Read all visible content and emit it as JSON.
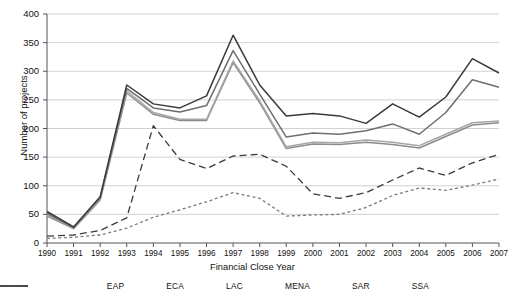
{
  "chart_data": {
    "type": "line",
    "title": "",
    "xlabel": "Financial Close Year",
    "ylabel": "Number of projects",
    "x": [
      1990,
      1991,
      1992,
      1993,
      1994,
      1995,
      1996,
      1997,
      1998,
      1999,
      2000,
      2001,
      2002,
      2003,
      2004,
      2005,
      2006,
      2007
    ],
    "xlim": [
      1990,
      2007
    ],
    "ylim": [
      0,
      400
    ],
    "yticks": [
      0,
      50,
      100,
      150,
      200,
      250,
      300,
      350,
      400
    ],
    "grid": true,
    "legend_position": "bottom",
    "series": [
      {
        "name": "EAP",
        "style": "dotted",
        "color": "#7a7a7a",
        "values": [
          8,
          10,
          14,
          26,
          45,
          58,
          72,
          88,
          78,
          47,
          49,
          50,
          62,
          83,
          96,
          92,
          101,
          112
        ]
      },
      {
        "name": "ECA",
        "style": "dashed",
        "color": "#3c3c3c",
        "values": [
          12,
          14,
          22,
          44,
          205,
          146,
          130,
          152,
          155,
          134,
          86,
          78,
          88,
          110,
          131,
          118,
          140,
          155
        ]
      },
      {
        "name": "LAC",
        "style": "solid",
        "color": "#8c8c8c",
        "values": [
          47,
          25,
          75,
          262,
          225,
          214,
          214,
          315,
          245,
          165,
          173,
          172,
          176,
          172,
          166,
          186,
          206,
          210
        ]
      },
      {
        "name": "MENA",
        "style": "solid",
        "color": "#a6a6a6",
        "values": [
          49,
          26,
          77,
          266,
          228,
          216,
          216,
          318,
          248,
          168,
          176,
          175,
          180,
          176,
          170,
          190,
          210,
          213
        ]
      },
      {
        "name": "SAR",
        "style": "solid",
        "color": "#6e6e6e",
        "values": [
          52,
          27,
          79,
          270,
          236,
          229,
          240,
          336,
          260,
          185,
          192,
          190,
          196,
          208,
          190,
          228,
          285,
          272
        ]
      },
      {
        "name": "SSA",
        "style": "solid",
        "color": "#3a3a3a",
        "values": [
          55,
          28,
          81,
          276,
          243,
          236,
          257,
          363,
          276,
          222,
          226,
          222,
          209,
          243,
          220,
          255,
          322,
          297
        ]
      }
    ]
  },
  "legend": {
    "items": [
      {
        "label": "EAP"
      },
      {
        "label": "ECA"
      },
      {
        "label": "LAC"
      },
      {
        "label": "MENA"
      },
      {
        "label": "SAR"
      },
      {
        "label": "SSA"
      }
    ]
  }
}
